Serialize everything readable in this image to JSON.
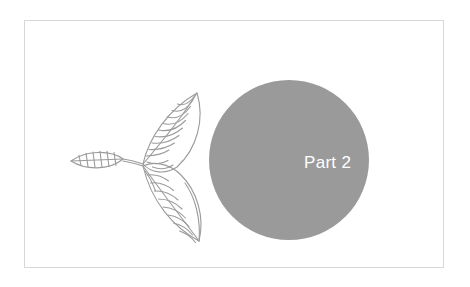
{
  "slide": {
    "background_color": "#ffffff",
    "frame": {
      "border_color": "#d8d8d8",
      "fill_color": "#ffffff"
    },
    "circle": {
      "fill_color": "#9a9a9a",
      "diameter_px": 160
    },
    "part_label": {
      "text": "Part 2",
      "color": "#ffffff"
    },
    "illustration": {
      "name": "leaf-branch-line-drawing",
      "stroke_color": "#9b9b9b",
      "leaf_count": 3
    }
  }
}
